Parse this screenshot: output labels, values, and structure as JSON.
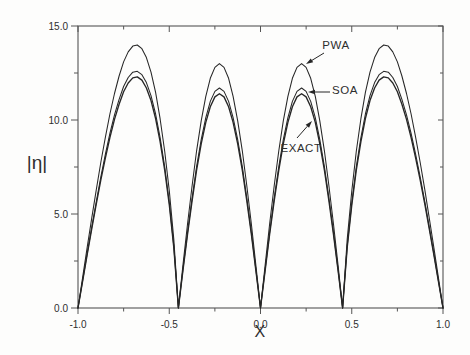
{
  "figure": {
    "bg_color": "#fdfdfc",
    "curve_color": "#262626",
    "frame_color": "#555555",
    "text_color": "#2e2e2e"
  },
  "chart_data": {
    "type": "line",
    "title": "",
    "xlabel": "X",
    "ylabel": "|η|",
    "xlim": [
      -1.0,
      1.0
    ],
    "ylim": [
      0.0,
      15.0
    ],
    "grid": false,
    "x_tick_labels": [
      "-1.0",
      "-0.5",
      "0.0",
      "0.5",
      "1.0"
    ],
    "x_tick_values": [
      -1.0,
      -0.5,
      0.0,
      0.5,
      1.0
    ],
    "x_minor_ticks": [
      -0.75,
      -0.25,
      0.25,
      0.75
    ],
    "y_tick_labels": [
      "0.0",
      "5.0",
      "10.0",
      "15.0"
    ],
    "y_tick_values": [
      0,
      5,
      10,
      15
    ],
    "y_minor_ticks": [
      2.5,
      7.5,
      12.5
    ],
    "zero_locations": [
      -1.0,
      -0.45,
      0.0,
      0.45,
      1.0
    ],
    "peak_locations": [
      -0.68,
      -0.225,
      0.225,
      0.68
    ],
    "peak_summary": {
      "PWA": {
        "inner_peak": 13.0,
        "outer_peak": 14.0
      },
      "SOA": {
        "inner_peak": 11.7,
        "outer_peak": 12.6
      },
      "EXACT": {
        "inner_peak": 11.4,
        "outer_peak": 12.3
      }
    },
    "x": [
      -1,
      -0.975,
      -0.95,
      -0.925,
      -0.9,
      -0.875,
      -0.85,
      -0.825,
      -0.8,
      -0.775,
      -0.75,
      -0.725,
      -0.7,
      -0.675,
      -0.65,
      -0.625,
      -0.6,
      -0.575,
      -0.55,
      -0.525,
      -0.5,
      -0.475,
      -0.45,
      -0.425,
      -0.4,
      -0.375,
      -0.35,
      -0.325,
      -0.3,
      -0.275,
      -0.25,
      -0.225,
      -0.2,
      -0.175,
      -0.15,
      -0.125,
      -0.1,
      -0.075,
      -0.05,
      -0.025,
      0,
      0.025,
      0.05,
      0.075,
      0.1,
      0.125,
      0.15,
      0.175,
      0.2,
      0.225,
      0.25,
      0.275,
      0.3,
      0.325,
      0.35,
      0.375,
      0.4,
      0.425,
      0.45,
      0.475,
      0.5,
      0.525,
      0.55,
      0.575,
      0.6,
      0.625,
      0.65,
      0.675,
      0.7,
      0.725,
      0.75,
      0.775,
      0.8,
      0.825,
      0.85,
      0.875,
      0.9,
      0.925,
      0.95,
      0.975,
      1
    ],
    "series": [
      {
        "name": "PWA",
        "values": [
          0,
          1.61,
          3.2,
          4.77,
          6.29,
          7.74,
          9.09,
          10.32,
          11.41,
          12.34,
          13.09,
          13.62,
          13.93,
          13.99,
          13.79,
          13.32,
          12.55,
          11.47,
          10.07,
          8.34,
          6.23,
          3.66,
          0,
          2.26,
          4.45,
          6.5,
          8.36,
          9.96,
          11.26,
          12.22,
          12.8,
          13,
          12.8,
          12.22,
          11.26,
          9.96,
          8.36,
          6.5,
          4.45,
          2.26,
          0,
          2.26,
          4.45,
          6.5,
          8.36,
          9.96,
          11.26,
          12.22,
          12.8,
          13,
          12.8,
          12.22,
          11.26,
          9.96,
          8.36,
          6.5,
          4.45,
          2.26,
          0,
          3.66,
          6.23,
          8.34,
          10.07,
          11.47,
          12.55,
          13.32,
          13.79,
          13.99,
          13.93,
          13.62,
          13.09,
          12.34,
          11.41,
          10.32,
          9.09,
          7.74,
          6.29,
          4.77,
          3.2,
          1.61,
          0
        ]
      },
      {
        "name": "SOA",
        "values": [
          0,
          1.45,
          2.88,
          4.29,
          5.66,
          6.97,
          8.18,
          9.29,
          10.27,
          11.1,
          11.78,
          12.26,
          12.54,
          12.59,
          12.41,
          11.99,
          11.29,
          10.32,
          9.07,
          7.51,
          5.61,
          3.29,
          0,
          2.03,
          4,
          5.85,
          7.52,
          8.96,
          10.13,
          10.99,
          11.52,
          11.7,
          11.52,
          10.99,
          10.13,
          8.96,
          7.52,
          5.85,
          4,
          2.03,
          0,
          2.03,
          4,
          5.85,
          7.52,
          8.96,
          10.13,
          10.99,
          11.52,
          11.7,
          11.52,
          10.99,
          10.13,
          8.96,
          7.52,
          5.85,
          4,
          2.03,
          0,
          3.29,
          5.61,
          7.51,
          9.07,
          10.32,
          11.29,
          11.99,
          12.41,
          12.59,
          12.54,
          12.26,
          11.78,
          11.1,
          10.27,
          9.29,
          8.18,
          6.97,
          5.66,
          4.29,
          2.88,
          1.45,
          0
        ]
      },
      {
        "name": "EXACT",
        "values": [
          0,
          1.41,
          2.81,
          4.19,
          5.53,
          6.8,
          7.99,
          9.07,
          10.03,
          10.84,
          11.5,
          11.97,
          12.24,
          12.29,
          12.12,
          11.7,
          11.03,
          10.08,
          8.85,
          7.33,
          5.48,
          3.21,
          0,
          1.98,
          3.9,
          5.7,
          7.33,
          8.73,
          9.87,
          10.71,
          11.23,
          11.4,
          11.23,
          10.71,
          9.87,
          8.73,
          7.33,
          5.7,
          3.9,
          1.98,
          0,
          1.98,
          3.9,
          5.7,
          7.33,
          8.73,
          9.87,
          10.71,
          11.23,
          11.4,
          11.23,
          10.71,
          9.87,
          8.73,
          7.33,
          5.7,
          3.9,
          1.98,
          0,
          3.21,
          5.48,
          7.33,
          8.85,
          10.08,
          11.03,
          11.7,
          12.12,
          12.29,
          12.24,
          11.97,
          11.5,
          10.84,
          10.03,
          9.07,
          7.99,
          6.8,
          5.53,
          4.19,
          2.81,
          1.41,
          0
        ]
      }
    ],
    "annotations": [
      {
        "label": "PWA",
        "text_x": 336,
        "text_y": 45,
        "arrow_from": [
          324,
          53
        ],
        "arrow_to": [
          306,
          64
        ]
      },
      {
        "label": "SOA",
        "text_x": 345,
        "text_y": 90,
        "arrow_from": [
          330,
          92
        ],
        "arrow_to": [
          308,
          92
        ]
      },
      {
        "label": "EXACT",
        "text_x": 301,
        "text_y": 148,
        "arrow_from": [
          297,
          138
        ],
        "arrow_to": [
          312,
          121
        ]
      }
    ]
  }
}
